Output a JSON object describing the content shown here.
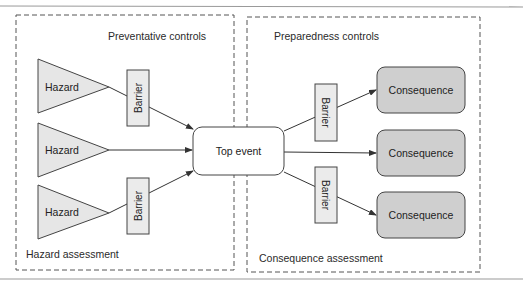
{
  "diagram": {
    "type": "bow-tie",
    "colors": {
      "line": "#333333",
      "hazard_fill": "#e6e6e6",
      "barrier_fill": "#ebebeb",
      "consequence_fill": "#cfcfcf",
      "top_event_fill": "#ffffff",
      "rule": "#999999"
    },
    "left_panel": {
      "title": "Preventative controls",
      "footer": "Hazard assessment"
    },
    "right_panel": {
      "title": "Preparedness controls",
      "footer": "Consequence assessment"
    },
    "top_event": {
      "label": "Top event"
    },
    "hazards": [
      {
        "label": "Hazard",
        "barrier": true
      },
      {
        "label": "Hazard",
        "barrier": false
      },
      {
        "label": "Hazard",
        "barrier": true
      }
    ],
    "hazard_barriers": [
      {
        "label": "Barrier"
      },
      {
        "label": "Barrier"
      }
    ],
    "consequences": [
      {
        "label": "Consequence",
        "barrier": true
      },
      {
        "label": "Consequence",
        "barrier": false
      },
      {
        "label": "Consequence",
        "barrier": true
      }
    ],
    "consequence_barriers": [
      {
        "label": "Barrier"
      },
      {
        "label": "Barrier"
      }
    ]
  }
}
